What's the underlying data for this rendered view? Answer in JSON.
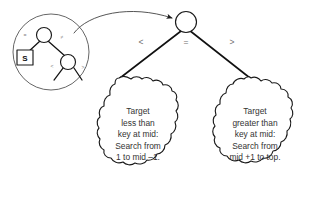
{
  "diagram": {
    "root_node": {
      "label": "",
      "name": "root-node"
    },
    "branches": [
      {
        "id": "less",
        "label": "<",
        "target": "left-blob"
      },
      {
        "id": "equal",
        "label": "=",
        "target": "root-node"
      },
      {
        "id": "greater",
        "label": ">",
        "target": "right-blob"
      }
    ],
    "blobs": [
      {
        "id": "left-blob",
        "lines": [
          "Target",
          "less than",
          "key at mid:",
          "Search from",
          "1 to mid –1."
        ]
      },
      {
        "id": "right-blob",
        "lines": [
          "Target",
          "greater than",
          "key at mid:",
          "Search from",
          "mid +1 to top."
        ]
      }
    ],
    "inset": {
      "name": "magnifier-inset",
      "box_label": "S",
      "edge_labels": [
        {
          "id": "inset-eq",
          "label": "="
        },
        {
          "id": "inset-neq",
          "label": "≠"
        },
        {
          "id": "inset-lt",
          "label": "<"
        },
        {
          "id": "inset-gt",
          "label": ">"
        }
      ]
    },
    "colors": {
      "stroke": "#1a1a1a",
      "label": "#6e6e6e",
      "background": "#ffffff",
      "lens": "#4a4a4a"
    }
  }
}
